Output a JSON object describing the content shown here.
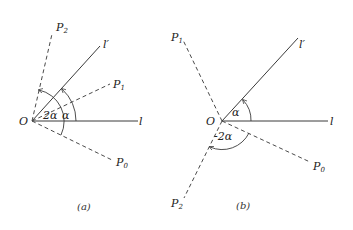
{
  "figure": {
    "panels": [
      {
        "id": "a",
        "caption": "(a)",
        "origin_label": "O",
        "lines": {
          "l": "l",
          "l_prime": "l′",
          "P0": "P",
          "P0_sub": "0",
          "P1": "P",
          "P1_sub": "1",
          "P2": "P",
          "P2_sub": "2"
        },
        "angles": {
          "alpha": "α",
          "two_alpha": "2α"
        }
      },
      {
        "id": "b",
        "caption": "(b)",
        "origin_label": "O",
        "lines": {
          "l": "l",
          "l_prime": "l′",
          "P0": "P",
          "P0_sub": "0",
          "P1": "P",
          "P1_sub": "1",
          "P2": "P",
          "P2_sub": "2"
        },
        "angles": {
          "alpha": "α",
          "neg_two_alpha": "-2α"
        }
      }
    ]
  }
}
